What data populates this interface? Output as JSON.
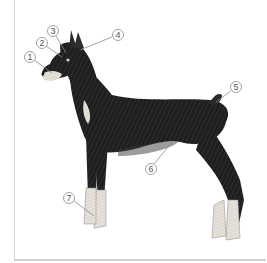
{
  "diagram": {
    "callouts": [
      {
        "label": "1",
        "cx": 30,
        "cy": 57,
        "tx": 52,
        "ty": 73
      },
      {
        "label": "2",
        "cx": 42,
        "cy": 43,
        "tx": 62,
        "ty": 57
      },
      {
        "label": "3",
        "cx": 53,
        "cy": 31,
        "tx": 66,
        "ty": 53
      },
      {
        "label": "4",
        "cx": 118,
        "cy": 35,
        "tx": 80,
        "ty": 50
      },
      {
        "label": "5",
        "cx": 236,
        "cy": 87,
        "tx": 214,
        "ty": 104
      },
      {
        "label": "6",
        "cx": 151,
        "cy": 169,
        "tx": 173,
        "ty": 140
      },
      {
        "label": "7",
        "cx": 69,
        "cy": 198,
        "tx": 96,
        "ty": 216
      }
    ],
    "colors": {
      "coat": "#1e1e1e",
      "tan": "#d9d2c8",
      "callout_stroke": "#8a8a8a",
      "frame": "#d4d4d4"
    }
  }
}
